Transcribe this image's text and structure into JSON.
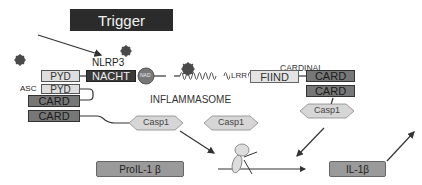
{
  "title": "Trigger",
  "labels": {
    "nlrp3": "NLRP3",
    "asc": "ASC",
    "cardinal": "CARDINAL",
    "inflammasome": "INFLAMMASOME",
    "lrr": "LRR",
    "nad": "NAD"
  },
  "domains": {
    "pyd_nlrp3": "PYD",
    "nacht": "NACHT",
    "pyd_asc": "PYD",
    "card_asc": "CARD",
    "card_lower": "CARD",
    "fiind": "FIIND",
    "card_cardinal_1": "CARD",
    "card_cardinal_2": "CARD"
  },
  "enzymes": {
    "casp1_left": "Casp1",
    "casp1_middle": "Casp1",
    "casp1_right": "Casp1"
  },
  "products": {
    "pro_il1b": "ProIL-1 β",
    "il1b": "IL-1β"
  },
  "colors": {
    "trigger_bg": "#2b2b2b",
    "card": "#777777",
    "pyd": "#dedede",
    "ligand": "#4a4a4a",
    "casp1": "#d6d6d6"
  }
}
